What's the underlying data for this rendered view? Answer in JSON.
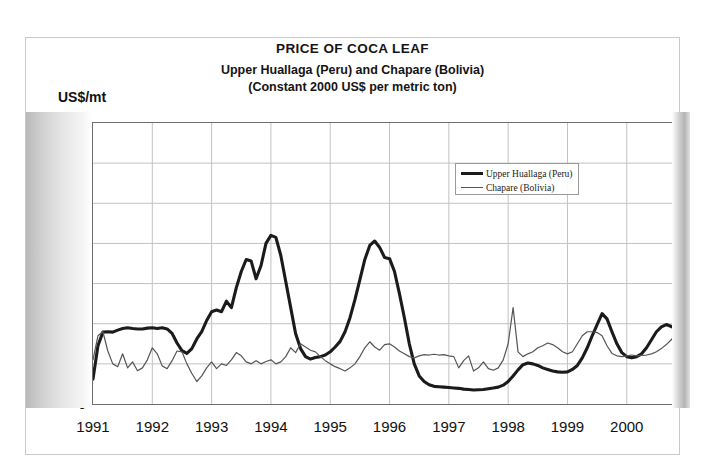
{
  "chart_data": {
    "type": "line",
    "title": "PRICE OF COCA LEAF",
    "subtitle_1": "Upper Huallaga (Peru) and Chapare (Bolivia)",
    "subtitle_2": "(Constant 2000 US$ per metric ton)",
    "ylabel": "US$/mt",
    "xlabel": "",
    "ylim": [
      0,
      7000
    ],
    "xlim": [
      1991,
      2000.83
    ],
    "grid": true,
    "legend_position": "upper-right-inside",
    "y_ticks": [
      7000,
      6000,
      5000,
      4000,
      3000,
      2000,
      1000,
      0
    ],
    "y_tick_labels": [
      "7,000",
      "6,000",
      "5,000",
      "4,000",
      "3,000",
      "2,000",
      "1,000",
      "0"
    ],
    "x_ticks": [
      1991,
      1992,
      1993,
      1994,
      1995,
      1996,
      1997,
      1998,
      1999,
      2000
    ],
    "x_tick_labels": [
      "1991",
      "1992",
      "1993",
      "1994",
      "1995",
      "1996",
      "1997",
      "1998",
      "1999",
      "2000"
    ],
    "series": [
      {
        "name": "Upper Huallaga (Peru)",
        "color": "#1b1b1b",
        "line_width": 3.1,
        "x_start": 1991.0,
        "x_step": 0.0833333,
        "values": [
          620,
          1450,
          1790,
          1800,
          1790,
          1840,
          1880,
          1900,
          1880,
          1870,
          1870,
          1890,
          1900,
          1880,
          1900,
          1870,
          1760,
          1520,
          1330,
          1260,
          1380,
          1620,
          1800,
          2080,
          2300,
          2340,
          2300,
          2560,
          2400,
          2900,
          3300,
          3600,
          3560,
          3120,
          3450,
          4000,
          4200,
          4150,
          3700,
          3050,
          2400,
          1750,
          1380,
          1180,
          1120,
          1160,
          1180,
          1220,
          1300,
          1420,
          1560,
          1800,
          2150,
          2600,
          3100,
          3600,
          3950,
          4060,
          3900,
          3650,
          3620,
          3300,
          2750,
          2150,
          1500,
          1000,
          700,
          560,
          480,
          440,
          430,
          420,
          410,
          400,
          390,
          370,
          360,
          350,
          355,
          360,
          380,
          400,
          420,
          470,
          560,
          700,
          850,
          980,
          1020,
          1000,
          960,
          900,
          860,
          820,
          800,
          790,
          800,
          860,
          960,
          1150,
          1400,
          1700,
          1980,
          2250,
          2120,
          1800,
          1500,
          1280,
          1180,
          1150,
          1180,
          1250,
          1400,
          1600,
          1800,
          1920,
          1980,
          1930,
          1860,
          1950,
          2050,
          2000,
          1920,
          1900,
          1980,
          2250,
          2700,
          3050,
          2850,
          2500,
          2350,
          2320,
          2380,
          2450,
          2600,
          2520,
          2380,
          2300,
          2420,
          2620,
          2850,
          3050,
          3250,
          3400,
          3150
        ]
      },
      {
        "name": "Chapare (Bolivia)",
        "color": "#555555",
        "line_width": 1.2,
        "x_start": 1991.0,
        "x_step": 0.0833333,
        "values": [
          1100,
          1700,
          1800,
          1320,
          1000,
          930,
          1250,
          900,
          1050,
          830,
          900,
          1100,
          1400,
          1250,
          950,
          880,
          1080,
          1320,
          1300,
          1000,
          760,
          560,
          700,
          900,
          1050,
          880,
          1000,
          960,
          1100,
          1280,
          1200,
          1050,
          1000,
          1080,
          1000,
          1060,
          1100,
          1000,
          1050,
          1180,
          1400,
          1280,
          1500,
          1420,
          1340,
          1300,
          1180,
          1080,
          1000,
          930,
          880,
          820,
          900,
          1000,
          1180,
          1400,
          1550,
          1420,
          1340,
          1480,
          1500,
          1420,
          1320,
          1250,
          1180,
          1150,
          1200,
          1230,
          1220,
          1240,
          1220,
          1230,
          1200,
          1180,
          900,
          1080,
          1200,
          820,
          900,
          1050,
          880,
          840,
          900,
          1100,
          1500,
          2400,
          1300,
          1180,
          1250,
          1300,
          1400,
          1450,
          1520,
          1480,
          1400,
          1300,
          1250,
          1300,
          1500,
          1700,
          1800,
          1800,
          1780,
          1700,
          1450,
          1260,
          1200,
          1180,
          1200,
          1220,
          1200,
          1210,
          1220,
          1250,
          1300,
          1380,
          1480,
          1600,
          1750,
          1850,
          2050,
          2150,
          2200,
          2350,
          2450,
          3200,
          4300,
          5000,
          5050,
          5050,
          5100,
          5150,
          5150,
          5200,
          6100,
          5550,
          5200,
          5600,
          5900,
          6020,
          6050,
          6050,
          6000,
          5800,
          4800
        ]
      }
    ]
  }
}
